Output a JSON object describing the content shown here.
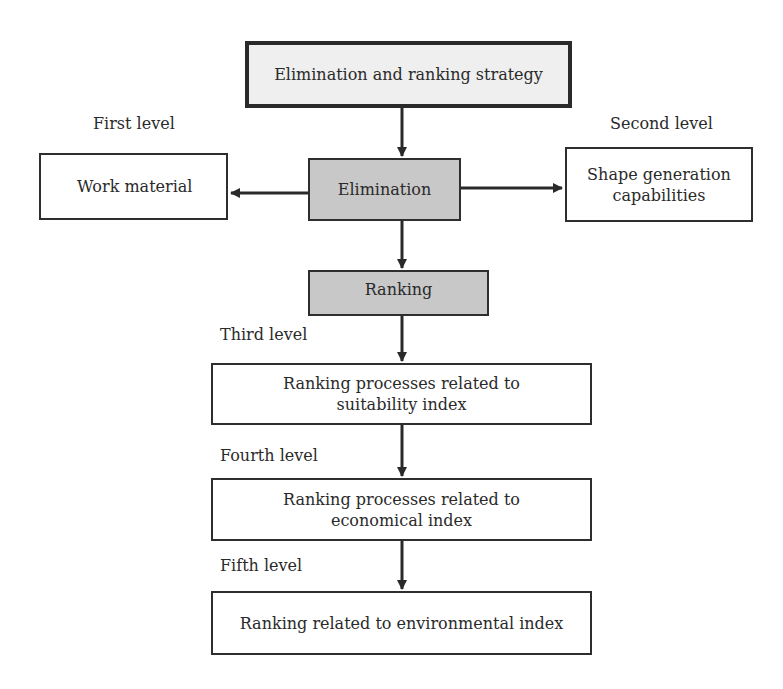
{
  "root": {
    "label": "Elimination and ranking strategy"
  },
  "elimination": {
    "label": "Elimination"
  },
  "first_level": {
    "label": "First level",
    "box": "Work material"
  },
  "second_level": {
    "label": "Second level",
    "box": "Shape generation capabilities"
  },
  "ranking": {
    "label": "Ranking"
  },
  "third_level": {
    "label": "Third level",
    "box": "Ranking processes related to suitability index"
  },
  "fourth_level": {
    "label": "Fourth level",
    "box": "Ranking processes related to economical index"
  },
  "fifth_level": {
    "label": "Fifth level",
    "box": "Ranking related to environmental index"
  },
  "colors": {
    "gray_fill": "#c8c8c8",
    "top_fill": "#efefef",
    "border": "#2e2e2e"
  }
}
